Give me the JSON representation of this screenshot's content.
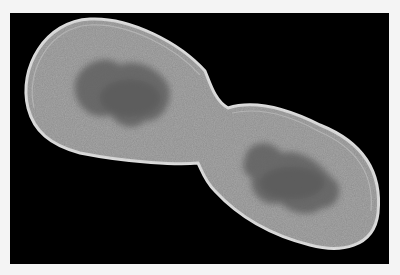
{
  "image": {
    "subject": "dividing rod-shaped bacterial cell (electron micrograph)",
    "colors": {
      "margin": "#f4f4f4",
      "background": "#000000",
      "cell_fill": "#8e8e8e",
      "cell_edge": "#d8d8d8",
      "nucleoid": "#6a6a6a"
    }
  }
}
